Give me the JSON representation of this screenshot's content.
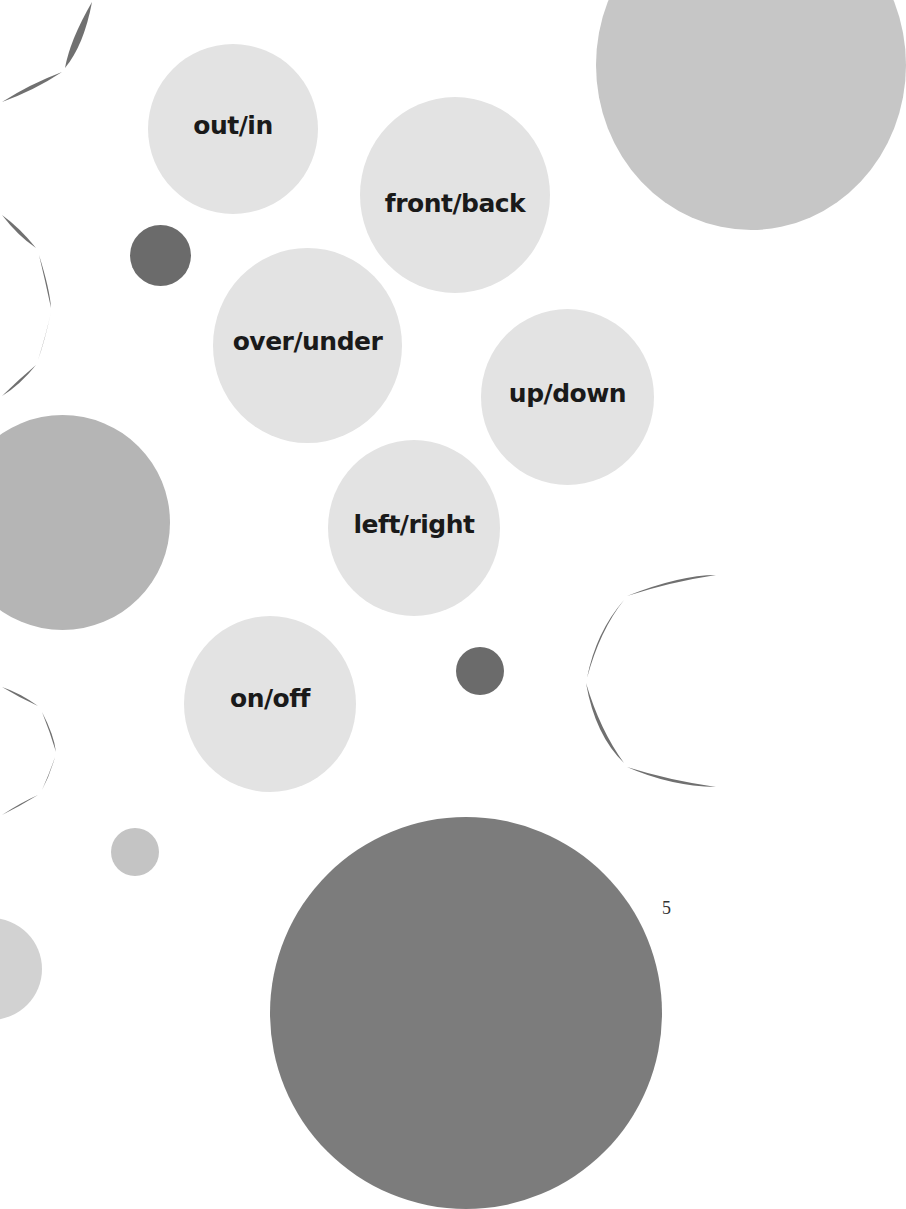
{
  "page": {
    "page_number": "5",
    "background": "#ffffff"
  },
  "colors": {
    "light_circle": "#e3e3e3",
    "medium_circle": "#b8b8b8",
    "dark_circle": "#6b6b6b",
    "arc_stroke": "#707070",
    "text": "#1a1a1a"
  },
  "word_circles": [
    {
      "label": "out/in"
    },
    {
      "label": "front/back"
    },
    {
      "label": "over/under"
    },
    {
      "label": "up/down"
    },
    {
      "label": "left/right"
    },
    {
      "label": "on/off"
    }
  ]
}
